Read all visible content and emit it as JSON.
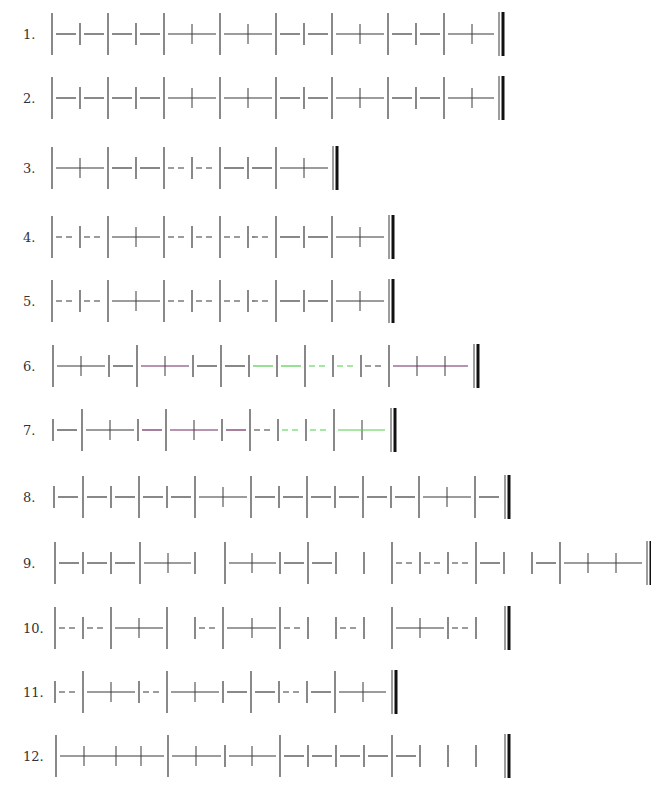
{
  "sheet": {
    "title": "Rhythm reading exercises (stick notation)",
    "beat_px": 28,
    "colors": {
      "ink": "#3a3a3a",
      "purple": "#6b2a62",
      "green": "#4fd04a"
    }
  },
  "rows": [
    {
      "label": "1.",
      "y": 34,
      "tall": [
        52,
        108,
        164,
        220,
        276,
        332,
        388,
        444
      ],
      "ticks": [
        80,
        136,
        304,
        416
      ],
      "cross": [
        192,
        248,
        360,
        472
      ],
      "segs": [
        [
          56,
          76,
          "s"
        ],
        [
          84,
          104,
          "s"
        ],
        [
          112,
          132,
          "s"
        ],
        [
          140,
          160,
          "s"
        ],
        [
          168,
          216,
          "s"
        ],
        [
          224,
          272,
          "s"
        ],
        [
          280,
          300,
          "s"
        ],
        [
          308,
          328,
          "s"
        ],
        [
          336,
          384,
          "s"
        ],
        [
          392,
          412,
          "s"
        ],
        [
          420,
          440,
          "s"
        ],
        [
          448,
          494,
          "s"
        ]
      ],
      "end": 499
    },
    {
      "label": "2.",
      "y": 98,
      "tall": [
        52,
        108,
        164,
        220,
        276,
        332,
        388,
        444
      ],
      "ticks": [
        80,
        136,
        304,
        416
      ],
      "cross": [
        192,
        248,
        360,
        472
      ],
      "segs": [
        [
          56,
          76,
          "s"
        ],
        [
          84,
          104,
          "s"
        ],
        [
          112,
          132,
          "s"
        ],
        [
          140,
          160,
          "s"
        ],
        [
          168,
          216,
          "s"
        ],
        [
          224,
          272,
          "s"
        ],
        [
          280,
          300,
          "s"
        ],
        [
          308,
          328,
          "s"
        ],
        [
          336,
          384,
          "s"
        ],
        [
          392,
          412,
          "s"
        ],
        [
          420,
          440,
          "s"
        ],
        [
          448,
          494,
          "s"
        ]
      ],
      "end": 499
    },
    {
      "label": "3.",
      "y": 168,
      "tall": [
        52,
        108,
        164,
        220,
        276
      ],
      "ticks": [
        136,
        192,
        248
      ],
      "cross": [
        80,
        304
      ],
      "segs": [
        [
          56,
          104,
          "s"
        ],
        [
          112,
          132,
          "s"
        ],
        [
          140,
          160,
          "s"
        ],
        [
          168,
          188,
          "d"
        ],
        [
          196,
          216,
          "d"
        ],
        [
          224,
          244,
          "s"
        ],
        [
          252,
          272,
          "s"
        ],
        [
          280,
          328,
          "s"
        ]
      ],
      "end": 333
    },
    {
      "label": "4.",
      "y": 237,
      "tall": [
        52,
        108,
        164,
        220,
        276,
        332
      ],
      "ticks": [
        80,
        192,
        248,
        304
      ],
      "cross": [
        136,
        360
      ],
      "segs": [
        [
          56,
          76,
          "d"
        ],
        [
          84,
          104,
          "d"
        ],
        [
          112,
          160,
          "s"
        ],
        [
          168,
          188,
          "d"
        ],
        [
          196,
          216,
          "d"
        ],
        [
          224,
          244,
          "d"
        ],
        [
          252,
          272,
          "d"
        ],
        [
          280,
          300,
          "s"
        ],
        [
          308,
          328,
          "s"
        ],
        [
          336,
          384,
          "s"
        ]
      ],
      "end": 389
    },
    {
      "label": "5.",
      "y": 301,
      "tall": [
        52,
        108,
        164,
        220,
        276,
        332
      ],
      "ticks": [
        80,
        192,
        248,
        304
      ],
      "cross": [
        136,
        360
      ],
      "segs": [
        [
          56,
          76,
          "d"
        ],
        [
          84,
          104,
          "d"
        ],
        [
          112,
          160,
          "s"
        ],
        [
          168,
          188,
          "d"
        ],
        [
          196,
          216,
          "d"
        ],
        [
          224,
          244,
          "d"
        ],
        [
          252,
          272,
          "d"
        ],
        [
          280,
          300,
          "s"
        ],
        [
          308,
          328,
          "s"
        ],
        [
          336,
          384,
          "s"
        ]
      ],
      "end": 389
    },
    {
      "label": "6.",
      "y": 366,
      "tall": [
        53,
        137,
        221,
        305,
        389
      ],
      "ticks": [
        109,
        193,
        249,
        277,
        333,
        361
      ],
      "cross": [
        81,
        165,
        417,
        445
      ],
      "segs": [
        [
          57,
          105,
          "s"
        ],
        [
          113,
          133,
          "s"
        ],
        [
          141,
          189,
          "s",
          "purple"
        ],
        [
          197,
          217,
          "s"
        ],
        [
          225,
          245,
          "s"
        ],
        [
          253,
          273,
          "s",
          "green"
        ],
        [
          281,
          301,
          "s",
          "green"
        ],
        [
          309,
          329,
          "d",
          "green"
        ],
        [
          337,
          357,
          "d",
          "green"
        ],
        [
          365,
          385,
          "d"
        ],
        [
          393,
          468,
          "s",
          "purple"
        ]
      ],
      "end": 474
    },
    {
      "label": "7.",
      "y": 430,
      "tall": [
        82,
        166,
        250,
        334
      ],
      "ticks": [
        53,
        138,
        222,
        278,
        306
      ],
      "cross": [
        110,
        194,
        362
      ],
      "segs": [
        [
          57,
          77,
          "s"
        ],
        [
          86,
          134,
          "s"
        ],
        [
          142,
          162,
          "s",
          "purple"
        ],
        [
          170,
          218,
          "s",
          "purple"
        ],
        [
          226,
          246,
          "s",
          "purple"
        ],
        [
          254,
          274,
          "d"
        ],
        [
          282,
          302,
          "d",
          "green"
        ],
        [
          310,
          330,
          "d",
          "green"
        ],
        [
          338,
          385,
          "s",
          "green"
        ]
      ],
      "end": 391
    },
    {
      "label": "8.",
      "y": 497,
      "tall": [
        83,
        139,
        195,
        251,
        307,
        363,
        419,
        475
      ],
      "ticks": [
        54,
        111,
        167,
        279,
        335,
        391
      ],
      "cross": [
        223,
        447
      ],
      "segs": [
        [
          58,
          78,
          "s"
        ],
        [
          87,
          107,
          "s"
        ],
        [
          115,
          135,
          "s"
        ],
        [
          143,
          163,
          "s"
        ],
        [
          171,
          191,
          "s"
        ],
        [
          199,
          247,
          "s"
        ],
        [
          255,
          275,
          "s"
        ],
        [
          283,
          303,
          "s"
        ],
        [
          311,
          331,
          "s"
        ],
        [
          339,
          359,
          "s"
        ],
        [
          367,
          387,
          "s"
        ],
        [
          395,
          415,
          "s"
        ],
        [
          423,
          471,
          "s"
        ],
        [
          479,
          499,
          "s"
        ]
      ],
      "end": 505
    },
    {
      "label": "9.",
      "y": 563,
      "tall": [
        55,
        140,
        225,
        308,
        392,
        476,
        560
      ],
      "ticks": [
        83,
        111,
        195,
        280,
        336,
        364,
        420,
        448,
        504,
        532
      ],
      "cross": [
        168,
        252,
        588,
        616
      ],
      "segs": [
        [
          59,
          79,
          "s"
        ],
        [
          87,
          107,
          "s"
        ],
        [
          115,
          135,
          "s"
        ],
        [
          144,
          191,
          "s"
        ],
        [
          229,
          276,
          "s"
        ],
        [
          284,
          304,
          "s"
        ],
        [
          312,
          332,
          "s"
        ],
        [
          396,
          416,
          "d"
        ],
        [
          424,
          444,
          "d"
        ],
        [
          452,
          472,
          "d"
        ],
        [
          480,
          500,
          "s"
        ],
        [
          536,
          556,
          "s"
        ],
        [
          564,
          642,
          "s"
        ]
      ],
      "end": 647
    },
    {
      "label": "10.",
      "y": 628,
      "tall": [
        55,
        111,
        167,
        223,
        280,
        392
      ],
      "ticks": [
        83,
        195,
        308,
        336,
        364,
        448,
        476
      ],
      "cross": [
        139,
        252,
        420
      ],
      "segs": [
        [
          59,
          79,
          "d"
        ],
        [
          87,
          107,
          "d"
        ],
        [
          115,
          163,
          "s"
        ],
        [
          199,
          219,
          "d"
        ],
        [
          227,
          276,
          "s"
        ],
        [
          284,
          304,
          "d"
        ],
        [
          340,
          360,
          "d"
        ],
        [
          396,
          444,
          "s"
        ],
        [
          452,
          472,
          "d"
        ]
      ],
      "end": 505
    },
    {
      "label": "11.",
      "y": 692,
      "tall": [
        83,
        167,
        251,
        335
      ],
      "ticks": [
        55,
        139,
        223,
        279,
        307
      ],
      "cross": [
        111,
        195,
        363
      ],
      "segs": [
        [
          59,
          79,
          "d"
        ],
        [
          87,
          135,
          "s"
        ],
        [
          143,
          163,
          "d"
        ],
        [
          171,
          219,
          "s"
        ],
        [
          227,
          247,
          "s"
        ],
        [
          255,
          275,
          "s"
        ],
        [
          283,
          303,
          "d"
        ],
        [
          311,
          331,
          "s"
        ],
        [
          339,
          386,
          "s"
        ]
      ],
      "end": 392
    },
    {
      "label": "12.",
      "y": 756,
      "tall": [
        56,
        168,
        280,
        392
      ],
      "ticks": [
        225,
        308,
        336,
        364,
        420,
        448,
        476
      ],
      "cross": [
        84,
        116,
        141,
        196,
        252
      ],
      "segs": [
        [
          60,
          164,
          "s"
        ],
        [
          172,
          221,
          "s"
        ],
        [
          229,
          276,
          "s"
        ],
        [
          284,
          304,
          "s"
        ],
        [
          312,
          332,
          "s"
        ],
        [
          340,
          360,
          "s"
        ],
        [
          368,
          388,
          "s"
        ],
        [
          396,
          416,
          "s"
        ]
      ],
      "end": 505
    }
  ]
}
